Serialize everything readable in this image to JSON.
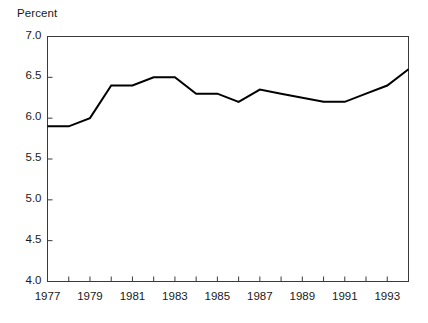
{
  "chart_data": {
    "type": "line",
    "title": "Percent",
    "xlabel": "",
    "ylabel": "Percent",
    "ylim": [
      4.0,
      7.0
    ],
    "xlim": [
      1977,
      1994
    ],
    "grid": false,
    "legend": null,
    "y_ticks": [
      "4.0",
      "4.5",
      "5.0",
      "5.5",
      "6.0",
      "6.5",
      "7.0"
    ],
    "y_tick_values": [
      4.0,
      4.5,
      5.0,
      5.5,
      6.0,
      6.5,
      7.0
    ],
    "x_ticks_labeled": [
      "1977",
      "1979",
      "1981",
      "1983",
      "1985",
      "1987",
      "1989",
      "1991",
      "1993"
    ],
    "x_tick_values_all": [
      1977,
      1978,
      1979,
      1980,
      1981,
      1982,
      1983,
      1984,
      1985,
      1986,
      1987,
      1988,
      1989,
      1990,
      1991,
      1992,
      1993,
      1994
    ],
    "x": [
      1977,
      1978,
      1979,
      1980,
      1981,
      1982,
      1983,
      1984,
      1985,
      1986,
      1987,
      1988,
      1989,
      1990,
      1991,
      1992,
      1993,
      1994
    ],
    "values": [
      5.9,
      5.9,
      6.0,
      6.4,
      6.4,
      6.5,
      6.5,
      6.3,
      6.3,
      6.2,
      6.35,
      6.3,
      6.25,
      6.2,
      6.2,
      6.3,
      6.4,
      6.6
    ],
    "series": [
      {
        "name": "Percent",
        "color": "#000000",
        "values": [
          5.9,
          5.9,
          6.0,
          6.4,
          6.4,
          6.5,
          6.5,
          6.3,
          6.3,
          6.2,
          6.35,
          6.3,
          6.25,
          6.2,
          6.2,
          6.3,
          6.4,
          6.6
        ]
      }
    ]
  },
  "style": {
    "axis_color": "#3a3a3a",
    "line_color": "#000000",
    "background": "#ffffff",
    "text_color": "#1a1a1a"
  }
}
